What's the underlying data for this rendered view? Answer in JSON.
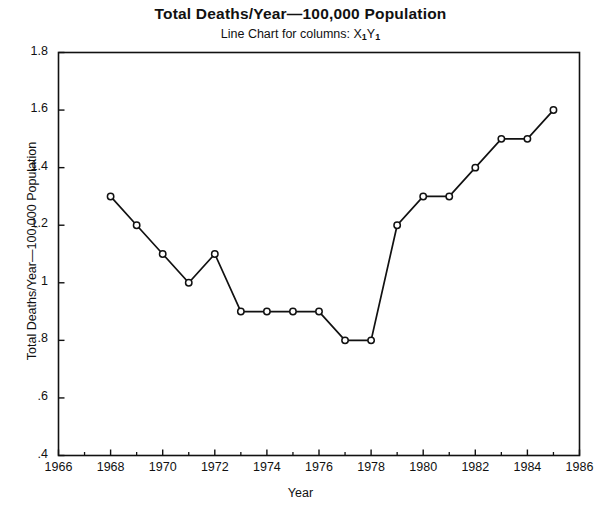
{
  "chart_data": {
    "type": "line",
    "title": "Total Deaths/Year—100,000 Population",
    "subtitle": "Line Chart for columns: X₁Y₁",
    "subtitle_prefix": "Line Chart for columns: X",
    "subtitle_sub1": "1",
    "subtitle_mid": "Y",
    "subtitle_sub2": "1",
    "xlabel": "Year",
    "ylabel": "Total Deaths/Year—100,000 Population",
    "xlim": [
      1966,
      1986
    ],
    "ylim": [
      0.4,
      1.8
    ],
    "xticks": [
      1966,
      1968,
      1970,
      1972,
      1974,
      1976,
      1978,
      1980,
      1982,
      1984,
      1986
    ],
    "xtick_labels": [
      "1966",
      "1968",
      "1970",
      "1972",
      "1974",
      "1976",
      "1978",
      "1980",
      "1982",
      "1984",
      "1986"
    ],
    "xminor_ticks": [
      1967,
      1969,
      1971,
      1973,
      1975,
      1977,
      1979,
      1981,
      1983,
      1985
    ],
    "yticks": [
      0.4,
      0.6,
      0.8,
      1.0,
      1.2,
      1.4,
      1.6,
      1.8
    ],
    "ytick_labels": [
      ".4",
      ".6",
      ".8",
      "1",
      "1.2",
      "1.4",
      "1.6",
      "1.8"
    ],
    "grid": false,
    "legend": false,
    "marker": "open-circle",
    "line_color": "#111111",
    "x": [
      1968,
      1969,
      1970,
      1971,
      1972,
      1973,
      1974,
      1975,
      1976,
      1977,
      1978,
      1979,
      1980,
      1981,
      1982,
      1983,
      1984,
      1985
    ],
    "values": [
      1.3,
      1.2,
      1.1,
      1.0,
      1.1,
      0.9,
      0.9,
      0.9,
      0.9,
      0.8,
      0.8,
      1.2,
      1.3,
      1.3,
      1.4,
      1.5,
      1.5,
      1.6
    ],
    "series": [
      {
        "name": "X₁Y₁",
        "x": [
          1968,
          1969,
          1970,
          1971,
          1972,
          1973,
          1974,
          1975,
          1976,
          1977,
          1978,
          1979,
          1980,
          1981,
          1982,
          1983,
          1984,
          1985
        ],
        "values": [
          1.3,
          1.2,
          1.1,
          1.0,
          1.1,
          0.9,
          0.9,
          0.9,
          0.9,
          0.8,
          0.8,
          1.2,
          1.3,
          1.3,
          1.4,
          1.5,
          1.5,
          1.6
        ]
      }
    ]
  }
}
